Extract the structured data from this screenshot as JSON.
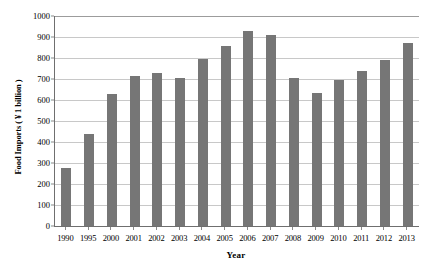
{
  "chart_data": {
    "type": "bar",
    "title": "",
    "xlabel": "Year",
    "ylabel": "Food Imports ( ¥ 1 billion )",
    "categories": [
      "1990",
      "1995",
      "2000",
      "2001",
      "2002",
      "2003",
      "2004",
      "2005",
      "2006",
      "2007",
      "2008",
      "2009",
      "2010",
      "2011",
      "2012",
      "2013"
    ],
    "values": [
      275,
      440,
      630,
      715,
      730,
      703,
      795,
      855,
      930,
      910,
      705,
      635,
      695,
      740,
      790,
      870
    ],
    "series": [
      {
        "name": "Food Imports",
        "values": [
          275,
          440,
          630,
          715,
          730,
          703,
          795,
          855,
          930,
          910,
          705,
          635,
          695,
          740,
          790,
          870
        ]
      }
    ],
    "ylim": [
      0,
      1000
    ],
    "y_ticks": [
      0,
      100,
      200,
      300,
      400,
      500,
      600,
      700,
      800,
      900,
      1000
    ],
    "y_tick_labels": [
      "0",
      "100",
      "200",
      "300",
      "400",
      "500",
      "600",
      "700",
      "800",
      "900",
      "1000"
    ],
    "grid": true,
    "grid_axis": "y",
    "legend": false,
    "legend_position": "none",
    "bar_color": "#767676",
    "gridline_color": "#c8c8c8",
    "axis_color": "#6f6f6f",
    "background": "#ffffff"
  }
}
